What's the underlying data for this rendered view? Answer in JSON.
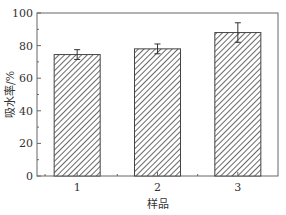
{
  "chart_data": {
    "type": "bar",
    "title": "",
    "xlabel": "样品",
    "ylabel": "吸水率/%",
    "categories": [
      "1",
      "2",
      "3"
    ],
    "values": [
      74.5,
      78,
      88
    ],
    "errors": [
      3,
      3,
      6
    ],
    "ylim": [
      0,
      100
    ],
    "yticks": [
      "0",
      "20",
      "40",
      "60",
      "80",
      "100"
    ],
    "grid": false,
    "bar_pattern": "diagonal-hatch",
    "colors": {
      "bar_fill": "#ffffff",
      "hatch": "#444444",
      "axis": "#555555"
    }
  }
}
